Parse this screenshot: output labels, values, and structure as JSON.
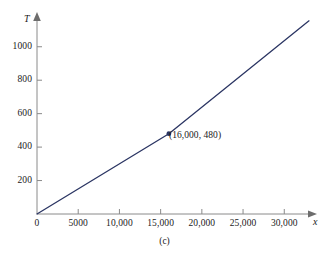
{
  "figure": {
    "caption": "(c)",
    "background_color": "#ffffff",
    "line_color": "#2b3563",
    "axis_color": "#8a8a8a",
    "text_color": "#1a1a1a"
  },
  "chart_data": {
    "type": "line",
    "title": "",
    "subtitle": "",
    "xlabel": "x",
    "ylabel": "T",
    "xlim": [
      0,
      33000
    ],
    "ylim": [
      0,
      1160
    ],
    "grid": false,
    "legend": null,
    "xticks": [
      0,
      5000,
      10000,
      15000,
      20000,
      25000,
      30000
    ],
    "xticklabels": [
      "0",
      "5000",
      "10,000",
      "15,000",
      "20,000",
      "25,000",
      "30,000"
    ],
    "yticks": [
      200,
      400,
      600,
      800,
      1000
    ],
    "yticklabels": [
      "200",
      "400",
      "600",
      "800",
      "1000"
    ],
    "series": [
      {
        "name": "T(x)",
        "x": [
          0,
          16000,
          33000
        ],
        "values": [
          0,
          480,
          1155
        ]
      }
    ],
    "markers": [
      {
        "x": 16000,
        "y": 480,
        "label": "(16,000, 480)"
      }
    ],
    "annotations": [
      {
        "text": "(16,000, 480)",
        "x": 16000,
        "y": 480
      }
    ]
  }
}
